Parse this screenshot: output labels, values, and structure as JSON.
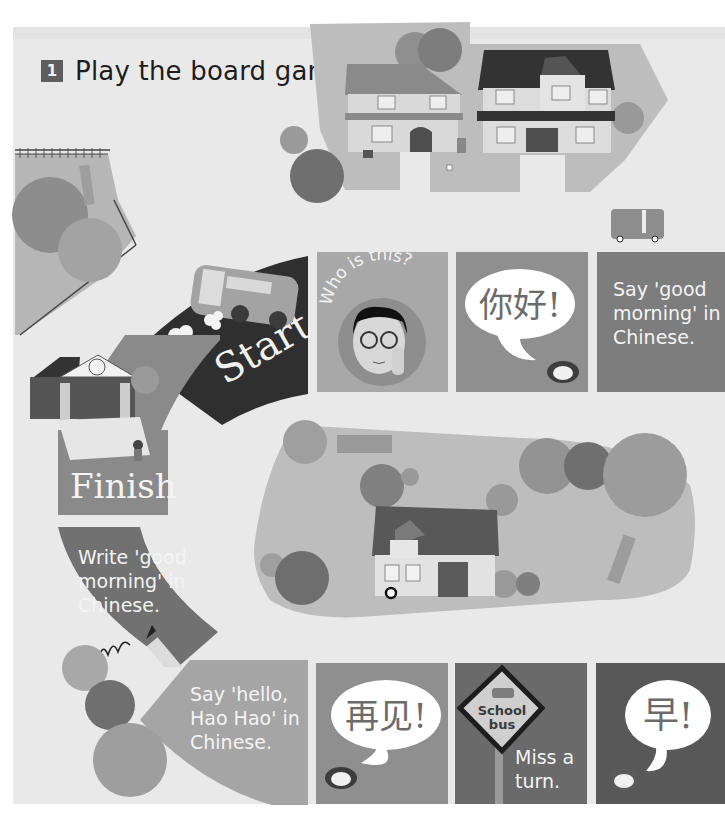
{
  "exercise": {
    "number": "1",
    "instruction": "Play the board game."
  },
  "board": {
    "start_label": "Start",
    "finish_label": "Finish",
    "tiles": [
      {
        "id": "start",
        "label": "Start",
        "icon": "bus-icon"
      },
      {
        "id": "who-is-this",
        "caption": "Who is this?",
        "icon": "teacher-portrait-icon"
      },
      {
        "id": "nihao",
        "bubble": "你好!",
        "icon": "mouth-icon"
      },
      {
        "id": "say-good-morning",
        "lines": [
          "Say 'good",
          "morning' in",
          "Chinese."
        ]
      },
      {
        "id": "zao",
        "bubble": "早!",
        "icon": "mouth-icon"
      },
      {
        "id": "miss-a-turn",
        "sign_lines": [
          "School",
          "bus"
        ],
        "lines": [
          "Miss a",
          "turn."
        ],
        "icon": "school-bus-sign-icon"
      },
      {
        "id": "zaijian",
        "bubble": "再见!",
        "icon": "mouth-icon"
      },
      {
        "id": "say-hello",
        "lines": [
          "Say 'hello,",
          "Hao Hao' in",
          "Chinese."
        ]
      },
      {
        "id": "write-good-morning",
        "lines": [
          "Write 'good",
          "morning' in",
          "Chinese."
        ],
        "icon": "pencil-icon"
      },
      {
        "id": "finish",
        "label": "Finish",
        "icon": "school-building-icon"
      }
    ]
  },
  "colors": {
    "page": "#e9e9e9",
    "start_tile": "#2f2f2f",
    "tile_light": "#a9a9a9",
    "tile_mid": "#9a9a9a",
    "tile_dark": "#7c7c7c",
    "tile_darker": "#6a6a6a",
    "tile_darkest": "#555555",
    "text_light": "#f4f4f4"
  }
}
